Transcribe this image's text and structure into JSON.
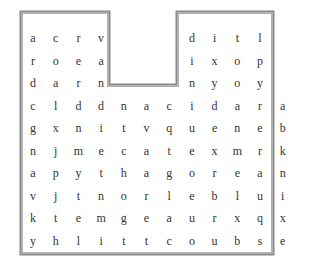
{
  "puzzle": {
    "type": "word-search",
    "rows": 10,
    "cols": 11,
    "grid": [
      [
        "a",
        "c",
        "r",
        "v",
        null,
        null,
        null,
        "d",
        "i",
        "t",
        "l"
      ],
      [
        "r",
        "o",
        "e",
        "a",
        null,
        null,
        null,
        "i",
        "x",
        "o",
        "p"
      ],
      [
        "d",
        "a",
        "r",
        "n",
        null,
        null,
        null,
        "n",
        "y",
        "o",
        "y"
      ],
      [
        "c",
        "l",
        "d",
        "d",
        "n",
        "a",
        "c",
        "i",
        "d",
        "a",
        "r",
        "a"
      ],
      [
        "g",
        "x",
        "n",
        "i",
        "t",
        "v",
        "q",
        "u",
        "e",
        "n",
        "e",
        "b"
      ],
      [
        "n",
        "j",
        "m",
        "e",
        "c",
        "a",
        "t",
        "e",
        "x",
        "m",
        "r",
        "k"
      ],
      [
        "a",
        "p",
        "y",
        "t",
        "h",
        "a",
        "g",
        "o",
        "r",
        "e",
        "a",
        "n"
      ],
      [
        "v",
        "j",
        "t",
        "n",
        "o",
        "r",
        "l",
        "e",
        "b",
        "l",
        "u",
        "i"
      ],
      [
        "k",
        "t",
        "e",
        "m",
        "g",
        "e",
        "a",
        "u",
        "r",
        "x",
        "q",
        "x"
      ],
      [
        "y",
        "h",
        "l",
        "i",
        "t",
        "t",
        "c",
        "o",
        "u",
        "b",
        "s",
        "e"
      ]
    ]
  }
}
